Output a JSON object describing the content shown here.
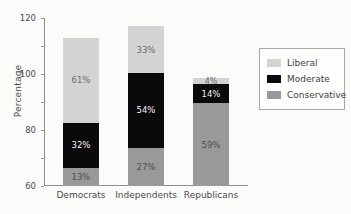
{
  "chart_data": {
    "type": "bar",
    "subtype": "stacked-bar",
    "title": "",
    "xlabel": "",
    "ylabel": "Percentage",
    "ylim": [
      0,
      120
    ],
    "ytick_step": 20,
    "yticks": [
      0,
      20,
      40,
      60,
      80,
      100,
      120
    ],
    "ytick_labels": [
      "0",
      "20",
      "40",
      "60",
      "80",
      "100",
      "120"
    ],
    "grid": false,
    "legend_position": "right",
    "categories": [
      "Democrats",
      "Independents",
      "Republicans"
    ],
    "series": [
      {
        "name": "Conservative",
        "color": "#999999",
        "values": [
          13,
          27,
          59
        ],
        "labels": [
          "13%",
          "27%",
          "59%"
        ]
      },
      {
        "name": "Moderate",
        "color": "#0a0a0a",
        "values": [
          32,
          54,
          14
        ],
        "labels": [
          "32%",
          "54%",
          "14%"
        ]
      },
      {
        "name": "Liberal",
        "color": "#d3d3d3",
        "values": [
          61,
          33,
          4
        ],
        "labels": [
          "61%",
          "33%",
          "4%"
        ]
      }
    ],
    "stack_order_bottom_to_top": [
      "Conservative",
      "Moderate",
      "Liberal"
    ],
    "totals": [
      106,
      114,
      77
    ]
  },
  "legend": {
    "entries": [
      {
        "label": "Liberal",
        "color": "#d3d3d3"
      },
      {
        "label": "Moderate",
        "color": "#0a0a0a"
      },
      {
        "label": "Conservative",
        "color": "#999999"
      }
    ]
  },
  "axis": {
    "y_title": "Percentage"
  },
  "colors": {
    "liberal": "#d3d3d3",
    "moderate": "#0a0a0a",
    "conservative": "#999999",
    "axis": "#8e8e8e",
    "background": "#fbfbfa"
  }
}
